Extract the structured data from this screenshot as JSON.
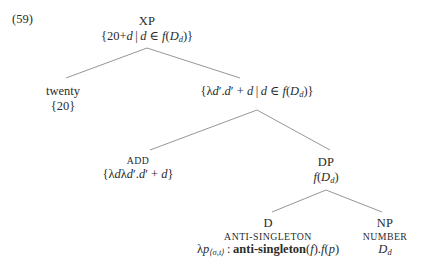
{
  "figure": {
    "number": "(59)",
    "type": "syntax-tree",
    "line_color": "#8a8a8a",
    "text_color": "#2b2b2b",
    "background": "#ffffff"
  },
  "nodes": {
    "xp": {
      "category": "XP",
      "denotation_plain": "{20+d | d ∈ f(D_d)}",
      "x": 147,
      "y": 14
    },
    "twenty": {
      "word": "twenty",
      "denotation_plain": "{20}",
      "x": 63,
      "y": 84
    },
    "addp": {
      "category": "",
      "denotation_plain": "{λd′.d′ + d | d ∈ f(D_d)}",
      "x": 257,
      "y": 84
    },
    "add": {
      "category": "ADD",
      "denotation_plain": "{λdλd′.d′ + d}",
      "x": 138,
      "y": 155
    },
    "dp": {
      "category": "DP",
      "denotation_plain": "f(D_d)",
      "x": 326,
      "y": 155
    },
    "d": {
      "category": "D",
      "lexical_item": "ANTI-SINGLETON",
      "denotation_plain": "λp⟨σ,t⟩ : anti-singleton(f).f(p)",
      "x": 268,
      "y": 216
    },
    "np": {
      "category": "NP",
      "lexical_item": "NUMBER",
      "denotation_plain": "D_d",
      "x": 385,
      "y": 216
    }
  },
  "edges": [
    {
      "name": "xp-to-twenty",
      "x1": 147,
      "y1": 48,
      "x2": 66,
      "y2": 78
    },
    {
      "name": "xp-to-addp",
      "x1": 147,
      "y1": 48,
      "x2": 240,
      "y2": 78
    },
    {
      "name": "addp-to-add",
      "x1": 257,
      "y1": 110,
      "x2": 150,
      "y2": 150
    },
    {
      "name": "addp-to-dp",
      "x1": 257,
      "y1": 110,
      "x2": 330,
      "y2": 150
    },
    {
      "name": "dp-to-d",
      "x1": 326,
      "y1": 190,
      "x2": 272,
      "y2": 212
    },
    {
      "name": "dp-to-np",
      "x1": 326,
      "y1": 190,
      "x2": 382,
      "y2": 212
    }
  ]
}
